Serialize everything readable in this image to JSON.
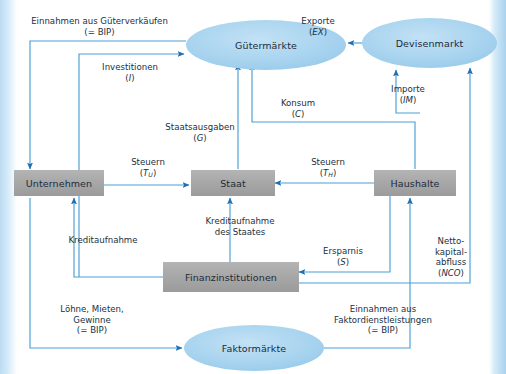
{
  "diagram": {
    "colors": {
      "box_fill": "#a9a9a9",
      "ellipse_fill": "#a8d3ee",
      "arrow": "#4a9fd5",
      "arrow_head": "#1f6fb2",
      "text": "#1c2b3a",
      "page_edge": "#bcdcf2"
    },
    "nodes": [
      {
        "id": "guetermaerkte",
        "label": "Gütermärkte",
        "shape": "ellipse",
        "x": 186,
        "y": 20,
        "w": 160,
        "h": 50
      },
      {
        "id": "devisenmarkt",
        "label": "Devisenmarkt",
        "shape": "ellipse",
        "x": 362,
        "y": 18,
        "w": 135,
        "h": 50
      },
      {
        "id": "unternehmen",
        "label": "Unternehmen",
        "shape": "box",
        "x": 14,
        "y": 170,
        "w": 90,
        "h": 26
      },
      {
        "id": "staat",
        "label": "Staat",
        "shape": "box",
        "x": 191,
        "y": 170,
        "w": 82,
        "h": 26
      },
      {
        "id": "haushalte",
        "label": "Haushalte",
        "shape": "box",
        "x": 374,
        "y": 170,
        "w": 82,
        "h": 26
      },
      {
        "id": "finanzinstitutionen",
        "label": "Finanzinstitutionen",
        "shape": "box",
        "x": 163,
        "y": 262,
        "w": 134,
        "h": 30
      },
      {
        "id": "faktormaerkte",
        "label": "Faktormärkte",
        "shape": "ellipse",
        "x": 184,
        "y": 325,
        "w": 140,
        "h": 46
      }
    ],
    "flows": [
      {
        "id": "einnahmen-gueterverkaeufe",
        "line1": "Einnahmen aus Güterverkäufen",
        "line2": "(= BIP)",
        "symbol": "",
        "from": "guetermaerkte",
        "to": "unternehmen"
      },
      {
        "id": "investitionen",
        "line1": "Investitionen",
        "line2": "(I)",
        "symbol": "I",
        "from": "finanzinstitutionen",
        "to": "guetermaerkte"
      },
      {
        "id": "staatsausgaben",
        "line1": "Staatsausgaben",
        "line2": "(G)",
        "symbol": "G",
        "from": "staat",
        "to": "guetermaerkte"
      },
      {
        "id": "konsum",
        "line1": "Konsum",
        "line2": "(C)",
        "symbol": "C",
        "from": "haushalte",
        "to": "guetermaerkte"
      },
      {
        "id": "exporte",
        "line1": "Exporte",
        "line2": "(EX)",
        "symbol": "EX",
        "from": "devisenmarkt",
        "to": "guetermaerkte"
      },
      {
        "id": "importe",
        "line1": "Importe",
        "line2": "(IM)",
        "symbol": "IM",
        "from": "haushalte",
        "to": "devisenmarkt"
      },
      {
        "id": "steuern-unternehmen",
        "line1": "Steuern",
        "line2": "(Tᴜ)",
        "symbol": "T",
        "sub": "U",
        "from": "unternehmen",
        "to": "staat"
      },
      {
        "id": "steuern-haushalte",
        "line1": "Steuern",
        "line2": "(Tʜ)",
        "symbol": "T",
        "sub": "H",
        "from": "haushalte",
        "to": "staat"
      },
      {
        "id": "kreditaufnahme",
        "line1": "Kreditaufnahme",
        "line2": "",
        "symbol": "",
        "from": "finanzinstitutionen",
        "to": "unternehmen"
      },
      {
        "id": "kreditaufnahme-staat",
        "line1": "Kreditaufnahme",
        "line2": "des Staates",
        "symbol": "",
        "from": "finanzinstitutionen",
        "to": "staat"
      },
      {
        "id": "ersparnis",
        "line1": "Ersparnis",
        "line2": "(S)",
        "symbol": "S",
        "from": "haushalte",
        "to": "finanzinstitutionen"
      },
      {
        "id": "nettokapitalabfluss",
        "line1": "Netto-",
        "line2": "kapital-",
        "line3": "abfluss",
        "line4": "(NCO)",
        "symbol": "NCO",
        "from": "finanzinstitutionen",
        "to": "devisenmarkt"
      },
      {
        "id": "loehne-mieten-gewinne",
        "line1": "Löhne, Mieten,",
        "line2": "Gewinne",
        "line3": "(= BIP)",
        "symbol": "",
        "from": "unternehmen",
        "to": "faktormaerkte"
      },
      {
        "id": "einnahmen-faktordienst",
        "line1": "Einnahmen aus",
        "line2": "Faktordienstleistungen",
        "line3": "(= BIP)",
        "symbol": "",
        "from": "faktormaerkte",
        "to": "haushalte"
      }
    ]
  }
}
